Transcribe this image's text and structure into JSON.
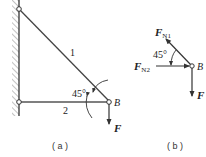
{
  "figure_a": {
    "caption": "( a )",
    "member1_label": "1",
    "member2_label": "2",
    "angle_label": "45°",
    "joint_label": "B",
    "force_label": "F"
  },
  "figure_b": {
    "caption": "( b )",
    "fn1_label": "F",
    "fn1_sub": "N1",
    "fn2_label": "F",
    "fn2_sub": "N2",
    "angle_label": "45°",
    "joint_label": "B",
    "force_label": "F"
  },
  "colors": {
    "line": "#333333",
    "hatch": "#888888"
  }
}
